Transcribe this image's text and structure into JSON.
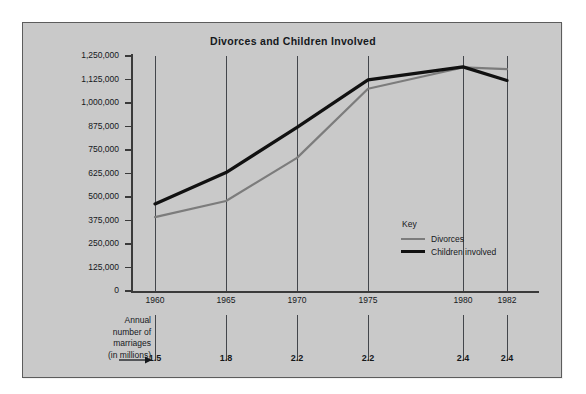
{
  "chart_data": {
    "type": "line",
    "title": "Divorces and Children Involved",
    "xlabel": "",
    "ylabel": "",
    "ylim": [
      0,
      1250000
    ],
    "grid": true,
    "legend_position": "inside-right",
    "categories": [
      "1960",
      "1965",
      "1970",
      "1975",
      "1980",
      "1982"
    ],
    "series": [
      {
        "name": "Divorces",
        "color": "#7c7c7c",
        "values": [
          393000,
          479000,
          708000,
          1076000,
          1189000,
          1180000
        ]
      },
      {
        "name": "Children involved",
        "color": "#111111",
        "values": [
          463000,
          630000,
          870000,
          1123000,
          1192000,
          1120000
        ]
      }
    ],
    "y_ticks": [
      0,
      125000,
      250000,
      375000,
      500000,
      625000,
      750000,
      875000,
      1000000,
      1125000,
      1250000
    ],
    "y_tick_labels": [
      "0",
      "125,000",
      "250,000",
      "375,000",
      "500,000",
      "625,000",
      "750,000",
      "875,000",
      "1,000,000",
      "1,125,000",
      "1,250,000"
    ],
    "annotations": {
      "marriages_label_lines": [
        "Annual",
        "number of",
        "marriages",
        "(in millions)"
      ],
      "marriages_values": [
        "1.5",
        "1.8",
        "2.2",
        "2.2",
        "2.4",
        "2.4"
      ]
    }
  },
  "legend": {
    "title": "Key",
    "entries": [
      {
        "label": "Divorces",
        "color": "#7c7c7c"
      },
      {
        "label": "Children involved",
        "color": "#111111"
      }
    ]
  },
  "colors": {
    "panel_background": "#c9c9c9",
    "panel_border": "#5c5c5c",
    "page_background": "#ffffff",
    "axis": "#3a3a3a",
    "gridline": "#43464b",
    "text": "#15181c"
  }
}
